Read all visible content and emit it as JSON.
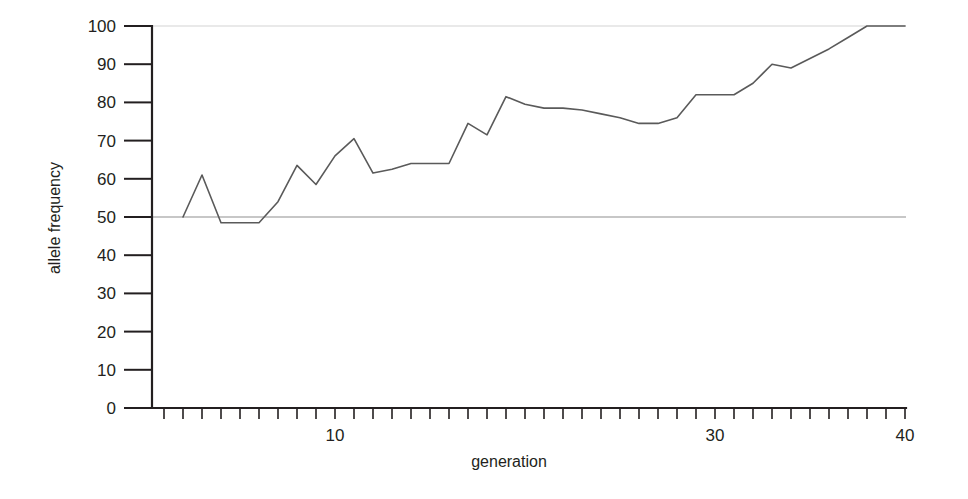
{
  "chart_data": {
    "type": "line",
    "title": "",
    "xlabel": "generation",
    "ylabel": "allele frequency",
    "xlim": [
      0,
      40
    ],
    "ylim": [
      0,
      100
    ],
    "grid": false,
    "legend": null,
    "x_tick_labels": [
      "10",
      "30",
      "40"
    ],
    "x_tick_values": [
      10,
      30,
      40
    ],
    "x_minor_tick_step": 1,
    "y_tick_labels": [
      "0",
      "10",
      "20",
      "30",
      "40",
      "50",
      "60",
      "70",
      "80",
      "90",
      "100"
    ],
    "y_tick_values": [
      0,
      10,
      20,
      30,
      40,
      50,
      60,
      70,
      80,
      90,
      100
    ],
    "reference_lines": [
      {
        "name": "fifty-percent-line",
        "y": 50,
        "color": "#8f8f8f"
      },
      {
        "name": "hundred-percent-line",
        "y": 100,
        "color": "#e2e2e2"
      }
    ],
    "series": [
      {
        "name": "allele frequency",
        "color": "#5a5a5a",
        "x": [
          2,
          3,
          4,
          5,
          6,
          7,
          8,
          9,
          10,
          11,
          12,
          13,
          14,
          15,
          16,
          17,
          18,
          19,
          20,
          21,
          22,
          23,
          24,
          25,
          26,
          27,
          28,
          29,
          30,
          31,
          32,
          33,
          34,
          35,
          36,
          37,
          38,
          39,
          40
        ],
        "values": [
          50,
          61,
          48.5,
          48.5,
          48.5,
          54,
          63.5,
          58.5,
          66,
          70.5,
          61.5,
          62.5,
          64,
          64,
          64,
          74.5,
          71.5,
          81.5,
          79.5,
          78.5,
          78.5,
          78,
          77,
          76,
          74.5,
          74.5,
          76,
          82,
          82,
          82,
          85,
          90,
          89,
          91.5,
          94,
          97,
          100,
          100,
          100
        ]
      }
    ]
  },
  "axis_titles": {
    "x": "generation",
    "y": "allele frequency"
  }
}
